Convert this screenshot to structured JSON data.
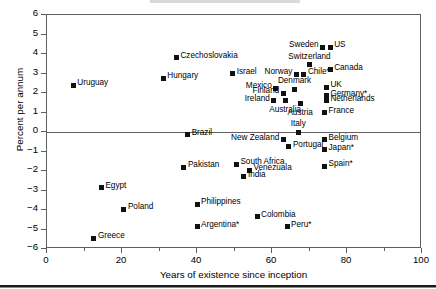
{
  "chart_data": {
    "type": "scatter",
    "title": "",
    "xlabel": "Years of existence since inception",
    "ylabel": "Percent per annum",
    "xlim": [
      0,
      100
    ],
    "ylim": [
      -6,
      6
    ],
    "xticks": [
      0,
      20,
      40,
      60,
      80,
      100
    ],
    "xticks_minor": [
      10,
      30,
      50,
      70,
      90
    ],
    "yticks": [
      6,
      5,
      4,
      3,
      2,
      1,
      0,
      -1,
      -2,
      -3,
      -4,
      -5,
      -6
    ],
    "xtick_labels": [
      "0",
      "20",
      "40",
      "60",
      "80",
      "100"
    ],
    "ytick_labels": [
      "6",
      "5",
      "4",
      "3",
      "2",
      "1",
      "0",
      "−1",
      "−2",
      "−3",
      "−4",
      "−5",
      "−6"
    ],
    "grid": false,
    "legend": "none",
    "zero_line": true,
    "marker_color": "#111111",
    "frame_color": "#5f5f5f",
    "points": [
      {
        "label": "Uruguay",
        "x": 7,
        "y": 2.4,
        "label_pos": "right"
      },
      {
        "label": "Hungary",
        "x": 31,
        "y": 2.75,
        "label_pos": "right"
      },
      {
        "label": "Czechoslovakia",
        "x": 34.5,
        "y": 3.8,
        "label_pos": "right"
      },
      {
        "label": "Israel",
        "x": 49.5,
        "y": 3.0,
        "label_pos": "right"
      },
      {
        "label": "Sweden",
        "x": 73.5,
        "y": 4.35,
        "label_pos": "left"
      },
      {
        "label": "US",
        "x": 75.5,
        "y": 4.35,
        "label_pos": "right"
      },
      {
        "label": "Switzerland",
        "x": 70,
        "y": 3.45,
        "label_pos": "above"
      },
      {
        "label": "Canada",
        "x": 75.5,
        "y": 3.2,
        "label_pos": "right"
      },
      {
        "label": "Norway",
        "x": 66.5,
        "y": 2.95,
        "label_pos": "left"
      },
      {
        "label": "Chile*",
        "x": 68.5,
        "y": 2.95,
        "label_pos": "right"
      },
      {
        "label": "Mexico",
        "x": 61,
        "y": 2.25,
        "label_pos": "left"
      },
      {
        "label": "UK",
        "x": 74.5,
        "y": 2.3,
        "label_pos": "right"
      },
      {
        "label": "Denmark",
        "x": 66,
        "y": 2.2,
        "label_pos": "above"
      },
      {
        "label": "Finland",
        "x": 63,
        "y": 2.0,
        "label_pos": "left"
      },
      {
        "label": "Germany*",
        "x": 74.5,
        "y": 1.85,
        "label_pos": "right"
      },
      {
        "label": "Ireland",
        "x": 60.5,
        "y": 1.6,
        "label_pos": "left"
      },
      {
        "label": "Australia",
        "x": 63.5,
        "y": 1.6,
        "label_pos": "below"
      },
      {
        "label": "Austria",
        "x": 67.5,
        "y": 1.45,
        "label_pos": "below"
      },
      {
        "label": "Netherlands",
        "x": 74.5,
        "y": 1.6,
        "label_pos": "right"
      },
      {
        "label": "France",
        "x": 74,
        "y": 1.0,
        "label_pos": "right"
      },
      {
        "label": "Italy",
        "x": 67,
        "y": 0.0,
        "label_pos": "above"
      },
      {
        "label": "Brazil",
        "x": 37.5,
        "y": -0.15,
        "label_pos": "right"
      },
      {
        "label": "New Zealand",
        "x": 63,
        "y": -0.4,
        "label_pos": "left"
      },
      {
        "label": "Belgium",
        "x": 74,
        "y": -0.4,
        "label_pos": "right"
      },
      {
        "label": "Portugal",
        "x": 64.5,
        "y": -0.75,
        "label_pos": "right"
      },
      {
        "label": "Japan*",
        "x": 74,
        "y": -0.9,
        "label_pos": "right"
      },
      {
        "label": "South Africa",
        "x": 50.5,
        "y": -1.65,
        "label_pos": "right"
      },
      {
        "label": "Pakistan",
        "x": 36.5,
        "y": -1.8,
        "label_pos": "right"
      },
      {
        "label": "Spain*",
        "x": 74,
        "y": -1.75,
        "label_pos": "right"
      },
      {
        "label": "Venezuala",
        "x": 54,
        "y": -1.95,
        "label_pos": "right"
      },
      {
        "label": "India",
        "x": 52.5,
        "y": -2.3,
        "label_pos": "right"
      },
      {
        "label": "Egypt",
        "x": 14.5,
        "y": -2.85,
        "label_pos": "right"
      },
      {
        "label": "Philippines",
        "x": 40,
        "y": -3.7,
        "label_pos": "right"
      },
      {
        "label": "Poland",
        "x": 20.5,
        "y": -3.95,
        "label_pos": "right"
      },
      {
        "label": "Colombia",
        "x": 56,
        "y": -4.35,
        "label_pos": "right"
      },
      {
        "label": "Argentina*",
        "x": 40,
        "y": -4.85,
        "label_pos": "right"
      },
      {
        "label": "Peru*",
        "x": 64,
        "y": -4.85,
        "label_pos": "right"
      },
      {
        "label": "Greece",
        "x": 12.5,
        "y": -5.45,
        "label_pos": "right"
      }
    ]
  }
}
